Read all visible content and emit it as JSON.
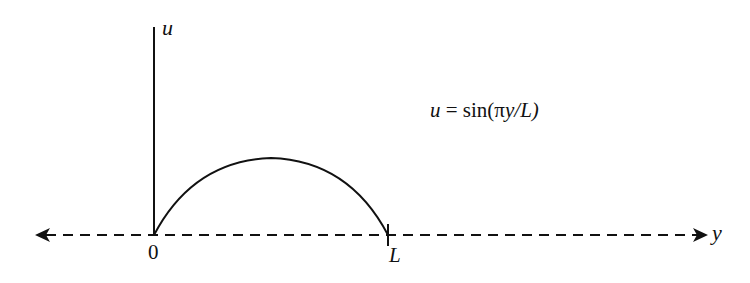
{
  "diagram": {
    "type": "function-plot-sketch",
    "axes": {
      "vertical": {
        "label": "u"
      },
      "horizontal": {
        "label": "y",
        "style": "dashed",
        "arrows": "both"
      }
    },
    "ticks": {
      "origin": "0",
      "end": "L"
    },
    "curve": {
      "description": "half sine arch from 0 to L",
      "equation": {
        "lhs": "u",
        "equals": " = ",
        "func": "sin(",
        "pi": "π",
        "var": "y",
        "slash": "/",
        "denom": "L",
        "close": ")"
      },
      "equation_text": "u = sin(πy/L)"
    },
    "colors": {
      "ink": "#111111",
      "background": "#ffffff"
    }
  }
}
